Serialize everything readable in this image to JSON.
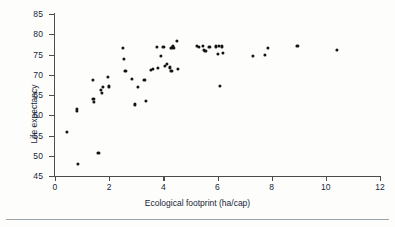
{
  "chart_data": {
    "type": "scatter",
    "title": "",
    "xlabel": "Ecological footprint (ha/cap)",
    "ylabel": "Life expectancy",
    "xlim": [
      0,
      12
    ],
    "ylim": [
      45,
      85
    ],
    "xticks": [
      0,
      2,
      4,
      6,
      8,
      10,
      12
    ],
    "yticks": [
      45,
      50,
      55,
      60,
      65,
      70,
      75,
      80,
      85
    ],
    "grid": false,
    "legend": false,
    "marker_color": "#141414",
    "axis_color": "#4d4d4d",
    "points": [
      {
        "x": 0.45,
        "y": 55.8
      },
      {
        "x": 0.8,
        "y": 61.5
      },
      {
        "x": 0.8,
        "y": 61.0
      },
      {
        "x": 0.85,
        "y": 48.0
      },
      {
        "x": 1.4,
        "y": 68.8
      },
      {
        "x": 1.42,
        "y": 64.0
      },
      {
        "x": 1.45,
        "y": 63.2
      },
      {
        "x": 1.6,
        "y": 50.8
      },
      {
        "x": 1.68,
        "y": 66.2
      },
      {
        "x": 1.72,
        "y": 65.6
      },
      {
        "x": 1.78,
        "y": 66.9
      },
      {
        "x": 1.95,
        "y": 69.4
      },
      {
        "x": 2.0,
        "y": 67.1
      },
      {
        "x": 2.5,
        "y": 76.7
      },
      {
        "x": 2.55,
        "y": 74.0
      },
      {
        "x": 2.6,
        "y": 71.0
      },
      {
        "x": 2.85,
        "y": 69.0
      },
      {
        "x": 2.95,
        "y": 62.7
      },
      {
        "x": 3.05,
        "y": 67.0
      },
      {
        "x": 3.3,
        "y": 68.8
      },
      {
        "x": 3.35,
        "y": 63.5
      },
      {
        "x": 3.55,
        "y": 71.2
      },
      {
        "x": 3.6,
        "y": 71.5
      },
      {
        "x": 3.75,
        "y": 76.9
      },
      {
        "x": 3.8,
        "y": 71.6
      },
      {
        "x": 3.9,
        "y": 74.7
      },
      {
        "x": 4.0,
        "y": 76.9
      },
      {
        "x": 4.05,
        "y": 72.2
      },
      {
        "x": 4.12,
        "y": 72.6
      },
      {
        "x": 4.25,
        "y": 71.8
      },
      {
        "x": 4.3,
        "y": 76.6
      },
      {
        "x": 4.35,
        "y": 77.0
      },
      {
        "x": 4.38,
        "y": 76.6
      },
      {
        "x": 4.3,
        "y": 70.9
      },
      {
        "x": 4.5,
        "y": 78.4
      },
      {
        "x": 4.55,
        "y": 71.4
      },
      {
        "x": 5.25,
        "y": 77.2
      },
      {
        "x": 5.3,
        "y": 76.8
      },
      {
        "x": 5.45,
        "y": 77.1
      },
      {
        "x": 5.5,
        "y": 76.2
      },
      {
        "x": 5.55,
        "y": 75.9
      },
      {
        "x": 5.7,
        "y": 76.9
      },
      {
        "x": 5.95,
        "y": 77.0
      },
      {
        "x": 6.0,
        "y": 75.2
      },
      {
        "x": 6.05,
        "y": 77.2
      },
      {
        "x": 6.1,
        "y": 67.3
      },
      {
        "x": 6.15,
        "y": 77.0
      },
      {
        "x": 6.2,
        "y": 75.4
      },
      {
        "x": 7.3,
        "y": 74.6
      },
      {
        "x": 7.75,
        "y": 75.0
      },
      {
        "x": 7.85,
        "y": 76.7
      },
      {
        "x": 8.95,
        "y": 77.2
      },
      {
        "x": 10.4,
        "y": 76.2
      }
    ]
  }
}
